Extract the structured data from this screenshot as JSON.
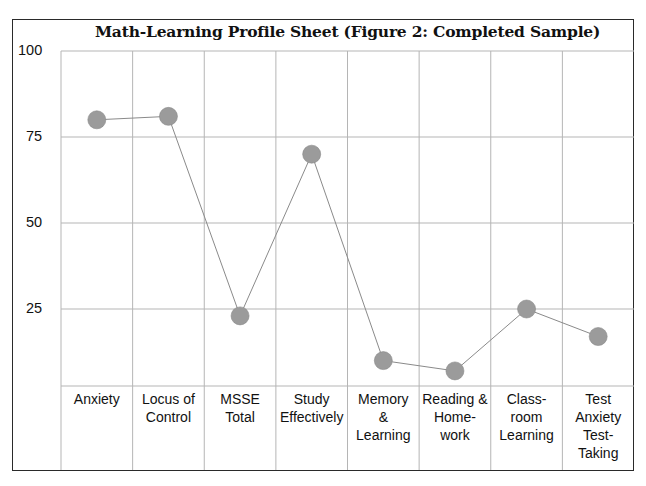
{
  "chart_data": {
    "type": "line",
    "title": "Math-Learning Profile Sheet (Figure 2: Completed Sample)",
    "xlabel": "",
    "ylabel": "",
    "ylim": [
      0,
      100
    ],
    "yticks": [
      "100",
      "75",
      "50",
      "25"
    ],
    "grid": true,
    "legend": null,
    "categories": [
      "Anxiety",
      "Locus of Control",
      "MSSE Total",
      "Study Effectively",
      "Memory & Learning",
      "Reading & Home-work",
      "Class-room Learning",
      "Test Anxiety Test-Taking"
    ],
    "category_label_lines": [
      [
        "Anxiety"
      ],
      [
        "Locus of",
        "Control"
      ],
      [
        "MSSE",
        "Total"
      ],
      [
        "Study",
        "Effectively"
      ],
      [
        "Memory",
        "&",
        "Learning"
      ],
      [
        "Reading &",
        "Home-",
        "work"
      ],
      [
        "Class-",
        "room",
        "Learning"
      ],
      [
        "Test",
        "Anxiety",
        "Test-",
        "Taking"
      ]
    ],
    "series": [
      {
        "name": "Completed Sample",
        "values": [
          80,
          81,
          23,
          70,
          10,
          7,
          25,
          17
        ]
      }
    ],
    "colors": {
      "marker": "#9b9b9b",
      "marker_edge": "#888888",
      "line": "#8a8a8a",
      "grid": "#b5b5b5",
      "frame": "#2a2a2a"
    }
  }
}
